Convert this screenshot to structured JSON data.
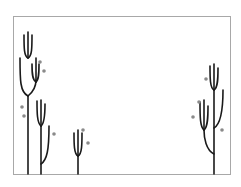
{
  "diagram": {
    "colors": {
      "stroke": "#1a1a1a",
      "dot": "#8a8a8a",
      "frame": "#a8a8a8",
      "background": "#ffffff"
    },
    "frame": {
      "x": 13,
      "y": 16,
      "width": 217,
      "height": 158
    },
    "plants": [
      {
        "name": "plant-tall-left",
        "paths": [
          "M28,174 L28,96",
          "M28,96 C20,92 20,80 20,58",
          "M28,96 C33,92 36,86 36,80",
          "M28,58 L28,32",
          "M28,58 C24,56 24,48 24,35",
          "M28,58 C32,56 32,48 32,35",
          "M36,82 L36,58",
          "M36,82 C32,80 32,72 32,64",
          "M36,82 C39,80 39,72 39,64"
        ],
        "dots": [
          {
            "x": 40,
            "y": 62
          },
          {
            "x": 44,
            "y": 71
          },
          {
            "x": 22,
            "y": 107
          },
          {
            "x": 24,
            "y": 116
          }
        ]
      },
      {
        "name": "plant-mid-left",
        "paths": [
          "M41,174 L41,126",
          "M41,126 C37,123 37,112 37,101",
          "M41,126 C45,123 45,112 45,104",
          "M41,126 L41,100",
          "M41,164 C47,160 49,150 49,126"
        ],
        "dots": [
          {
            "x": 54,
            "y": 134
          }
        ]
      },
      {
        "name": "plant-short-center",
        "paths": [
          "M78,174 L78,156",
          "M78,156 C74,154 74,144 74,133",
          "M78,156 C82,154 82,144 82,133",
          "M78,156 L78,130"
        ],
        "dots": [
          {
            "x": 83,
            "y": 130
          },
          {
            "x": 88,
            "y": 143
          }
        ]
      },
      {
        "name": "plant-right",
        "paths": [
          "M214,174 L214,90",
          "M214,90 C210,88 210,78 210,66",
          "M214,90 C218,88 218,78 218,68",
          "M214,90 L214,64",
          "M214,128 C221,124 223,110 223,90",
          "M214,154 C206,150 204,138 204,130",
          "M204,130 C200,127 200,116 200,102",
          "M204,130 C208,127 208,116 208,106",
          "M204,130 L204,100"
        ],
        "dots": [
          {
            "x": 206,
            "y": 79
          },
          {
            "x": 199,
            "y": 102
          },
          {
            "x": 193,
            "y": 117
          },
          {
            "x": 222,
            "y": 130
          }
        ]
      }
    ]
  }
}
